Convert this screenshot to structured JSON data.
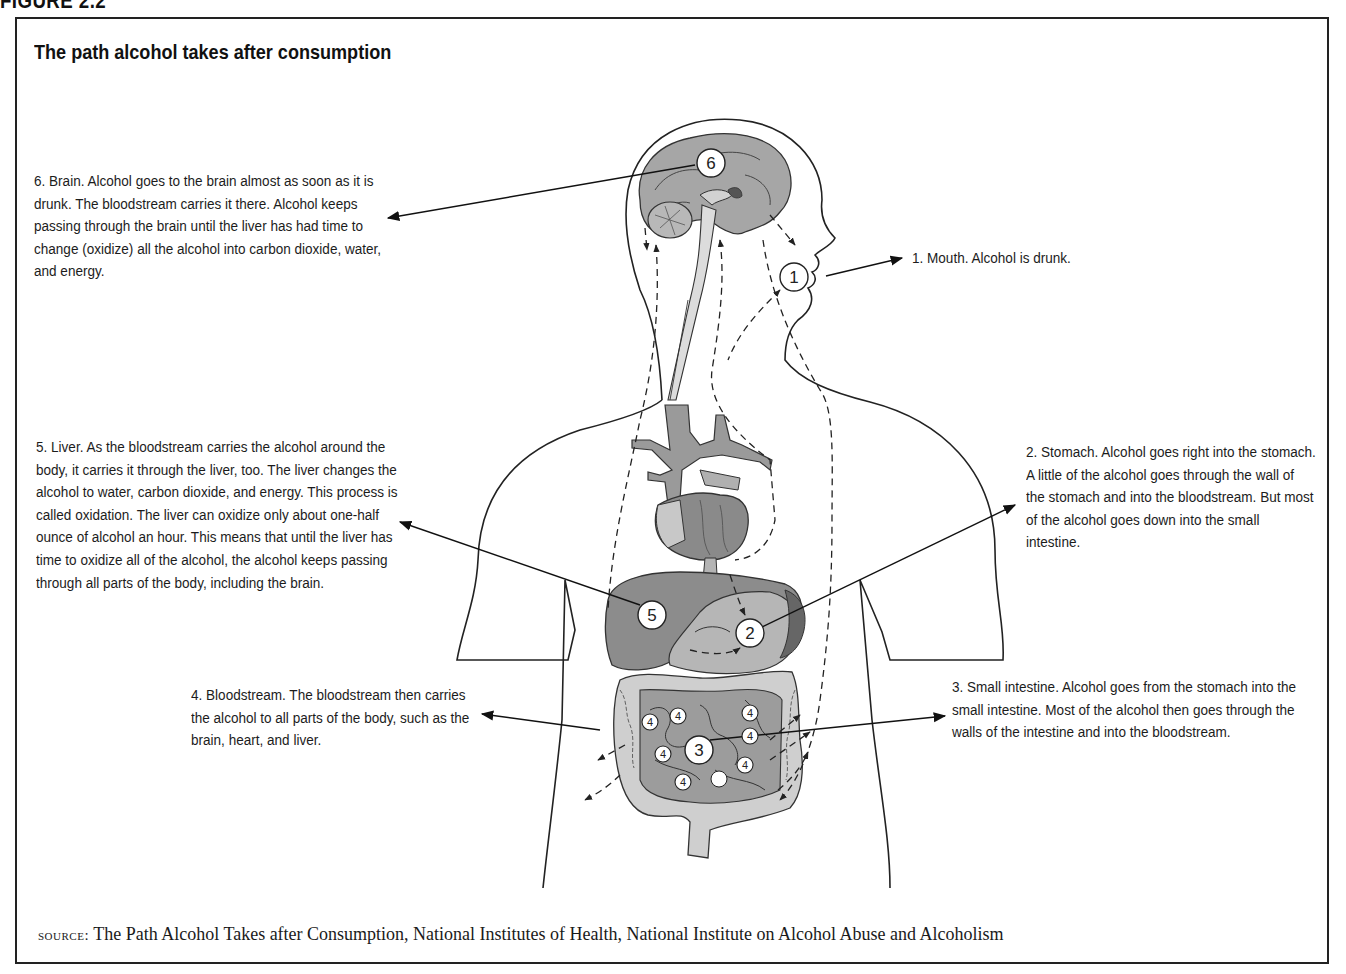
{
  "figure": {
    "label": "FIGURE 2.2",
    "title": "The path alcohol takes after consumption"
  },
  "steps": [
    {
      "number": "1",
      "name": "Mouth",
      "text": "1. Mouth. Alcohol is drunk."
    },
    {
      "number": "2",
      "name": "Stomach",
      "text": "2. Stomach. Alcohol goes right into the stomach. A little of the alcohol goes through the wall of the stomach and into the bloodstream. But most of the alcohol goes down into the small intestine."
    },
    {
      "number": "3",
      "name": "Small intestine",
      "text": "3. Small intestine. Alcohol goes from the stomach into the small intestine. Most of the alcohol then goes through the walls of the intestine and into the bloodstream."
    },
    {
      "number": "4",
      "name": "Bloodstream",
      "text": "4. Bloodstream. The bloodstream then carries the alcohol to all parts of the body, such as the brain, heart, and liver."
    },
    {
      "number": "5",
      "name": "Liver",
      "text": "5. Liver. As the bloodstream carries the alcohol around the body, it carries it through the liver, too. The liver changes the alcohol to water, carbon dioxide, and energy. This process is called oxidation. The liver can oxidize only about one-half ounce of alcohol an hour. This means that until the liver has time to oxidize all of the alcohol, the alcohol keeps passing through all parts of the body, including the brain."
    },
    {
      "number": "6",
      "name": "Brain",
      "text": "6. Brain. Alcohol goes to the brain almost as soon as it is drunk. The bloodstream carries it there. Alcohol keeps passing through the brain until the liver has had time to change (oxidize) all the alcohol into carbon dioxide, water, and energy."
    }
  ],
  "markers": {
    "m1": "1",
    "m2": "2",
    "m3": "3",
    "m4": "4",
    "m5": "5",
    "m6": "6"
  },
  "source": {
    "keyword": "source:",
    "text": " The Path Alcohol Takes after Consumption, National Institutes of Health, National Institute on Alcohol Abuse and Alcoholism"
  },
  "colors": {
    "organ_dark": "#7d7d7d",
    "organ_mid": "#9a9a9a",
    "organ_light": "#c4c4c4",
    "outline": "#222222"
  }
}
